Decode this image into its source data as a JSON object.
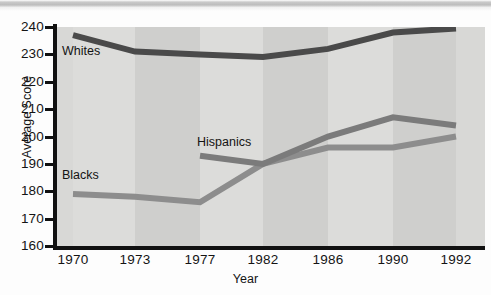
{
  "figure": {
    "header_strip": "",
    "background_color": "#d8d8d6"
  },
  "axis": {
    "y_title": "Average Score",
    "x_title": "Year"
  },
  "labels": {
    "whites": "Whites",
    "blacks": "Blacks",
    "hispanics": "Hispanics"
  },
  "chart_data": {
    "type": "line",
    "title": "",
    "subtitle": "",
    "xlabel": "Year",
    "ylabel": "Average Score",
    "x": [
      1970,
      1973,
      1977,
      1982,
      1986,
      1990,
      1992
    ],
    "categories": [
      "1970",
      "1973",
      "1977",
      "1982",
      "1986",
      "1990",
      "1992"
    ],
    "xtick_labels": [
      "1970",
      "1973",
      "1977",
      "1982",
      "1986",
      "1990",
      "1992"
    ],
    "ytick_labels": [
      "240",
      "230",
      "220",
      "210",
      "200",
      "190",
      "180",
      "170",
      "160"
    ],
    "ylim": [
      160,
      240
    ],
    "ytick_step": 10,
    "grid": false,
    "legend": "inline-labels",
    "legend_position": "in-plot",
    "series": [
      {
        "name": "Whites",
        "color": "#4a4a4a",
        "x": [
          1970,
          1973,
          1977,
          1982,
          1986,
          1990,
          1992
        ],
        "values": [
          237,
          231,
          230,
          229,
          232,
          238,
          239.5
        ],
        "label_text": "Whites"
      },
      {
        "name": "Blacks",
        "color": "#8d8d8d",
        "x": [
          1970,
          1973,
          1977,
          1982,
          1986,
          1990,
          1992
        ],
        "values": [
          179,
          178,
          176,
          190,
          196,
          196,
          200
        ],
        "label_text": "Blacks"
      },
      {
        "name": "Hispanics",
        "color": "#7b7b7b",
        "x": [
          1977,
          1982,
          1986,
          1990,
          1992
        ],
        "values": [
          193,
          190,
          200,
          207,
          204
        ],
        "label_text": "Hispanics"
      }
    ],
    "background_bands": [
      {
        "from": 1970,
        "to": 1973,
        "shade": "light"
      },
      {
        "from": 1973,
        "to": 1977,
        "shade": "dark"
      },
      {
        "from": 1977,
        "to": 1982,
        "shade": "light"
      },
      {
        "from": 1982,
        "to": 1986,
        "shade": "dark"
      },
      {
        "from": 1986,
        "to": 1990,
        "shade": "light"
      },
      {
        "from": 1990,
        "to": 1992,
        "shade": "dark"
      }
    ]
  }
}
